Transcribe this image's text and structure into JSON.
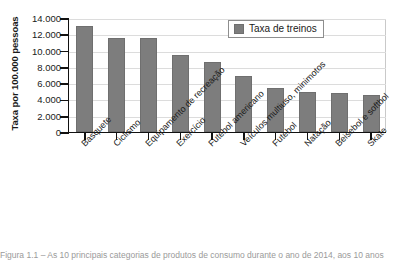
{
  "chart_data": {
    "type": "bar",
    "title": "",
    "xlabel": "",
    "ylabel": "Taxa por 100.000 pessoas",
    "ylim": [
      0,
      14000
    ],
    "ytick_labels": [
      "0",
      "2.000",
      "4.000",
      "6.000",
      "8.000",
      "10.000",
      "12.000",
      "14.000"
    ],
    "ytick_values": [
      0,
      2000,
      4000,
      6000,
      8000,
      10000,
      12000,
      14000
    ],
    "grid": true,
    "legend_position": "top-right",
    "legend": [
      "Taxa de treinos"
    ],
    "categories": [
      "Basquete",
      "Ciclismo",
      "Equipamento de recreação",
      "Exercício",
      "Futebol americano",
      "Veículos multiuso, minimotos",
      "Futebol",
      "Natação",
      "Beisebol e softbol",
      "Skate"
    ],
    "series": [
      {
        "name": "Taxa de treinos",
        "values": [
          13000,
          11500,
          11500,
          9500,
          8600,
          6900,
          5400,
          4900,
          4800,
          4500
        ]
      }
    ],
    "bar_color": "#7d7d7d"
  },
  "legend": {
    "label": "Taxa de treinos"
  },
  "axes": {
    "y_title": "Taxa por 100.000 pessoas"
  },
  "caption": {
    "text": "Figura 1.1 – As 10 principais categorias de produtos de consumo durante o ano de 2014, aos 10 anos"
  }
}
